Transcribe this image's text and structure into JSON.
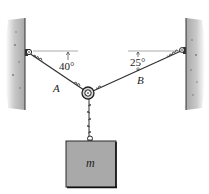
{
  "diagram": {
    "type": "statics-cable-ring-suspension",
    "left_cable": {
      "label": "A",
      "angle_label": "40°",
      "angle_deg": 40
    },
    "right_cable": {
      "label": "B",
      "angle_label": "25°",
      "angle_deg": 25
    },
    "block": {
      "label": "m"
    },
    "colors": {
      "wall": "#b8b8b8",
      "block_fill": "#a9a9a9",
      "block_edge": "#2a2a2a",
      "cable": "#333333",
      "reference_line": "#888888"
    }
  }
}
